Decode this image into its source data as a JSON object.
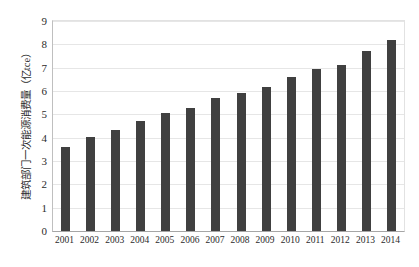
{
  "chart_data": {
    "type": "bar",
    "title": "",
    "xlabel": "",
    "ylabel": "建筑部门一次能源消费量（亿tce）",
    "ylim": [
      0,
      9
    ],
    "ytick_labels": [
      "0",
      "1",
      "2",
      "3",
      "4",
      "5",
      "6",
      "7",
      "8",
      "9"
    ],
    "grid": true,
    "legend": "none",
    "series_color": "#404040",
    "categories": [
      "2001",
      "2002",
      "2003",
      "2004",
      "2005",
      "2006",
      "2007",
      "2008",
      "2009",
      "2010",
      "2011",
      "2012",
      "2013",
      "2014"
    ],
    "values": [
      3.62,
      4.02,
      4.32,
      4.7,
      5.05,
      5.27,
      5.68,
      5.92,
      6.16,
      6.6,
      6.95,
      7.12,
      7.72,
      8.2
    ]
  }
}
